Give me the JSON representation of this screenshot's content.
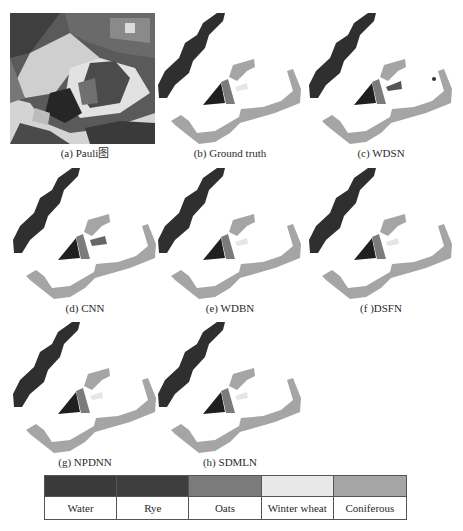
{
  "panels": [
    {
      "id": "a",
      "caption": "(a) Pauli图",
      "type": "pauli"
    },
    {
      "id": "b",
      "caption": "(b) Ground truth",
      "type": "map"
    },
    {
      "id": "c",
      "caption": "(c) WDSN",
      "type": "map"
    },
    {
      "id": "d",
      "caption": "(d) CNN",
      "type": "map"
    },
    {
      "id": "e",
      "caption": "(e) WDBN",
      "type": "map"
    },
    {
      "id": "f",
      "caption": "(f )DSFN",
      "type": "map"
    },
    {
      "id": "g",
      "caption": "(g) NPDNN",
      "type": "map"
    },
    {
      "id": "h",
      "caption": "(h) SDMLN",
      "type": "map"
    }
  ],
  "legend": {
    "classes": [
      {
        "label": "Water",
        "color": "#3a3a3a"
      },
      {
        "label": "Rye",
        "color": "#3e3e3e"
      },
      {
        "label": "Oats",
        "color": "#7b7b7b"
      },
      {
        "label": "Winter wheat",
        "color": "#e8e8e8"
      },
      {
        "label": "Coniferous",
        "color": "#a5a5a5"
      }
    ]
  }
}
